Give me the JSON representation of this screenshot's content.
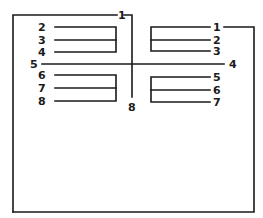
{
  "diagram": {
    "type": "terminal-wiring-schematic",
    "top_labels": {
      "left_one": "1",
      "center_bottom": "8"
    },
    "left_group": {
      "top_rows": [
        {
          "label": "2",
          "y": 27
        },
        {
          "label": "3",
          "y": 40
        },
        {
          "label": "4",
          "y": 52
        }
      ],
      "bottom_rows": [
        {
          "label": "6",
          "y": 75
        },
        {
          "label": "7",
          "y": 88
        },
        {
          "label": "8",
          "y": 101
        }
      ]
    },
    "right_group": {
      "top_rows": [
        {
          "label": "1",
          "y": 27
        },
        {
          "label": "2",
          "y": 40
        },
        {
          "label": "3",
          "y": 51
        }
      ],
      "bottom_rows": [
        {
          "label": "5",
          "y": 77
        },
        {
          "label": "6",
          "y": 90
        },
        {
          "label": "7",
          "y": 102
        }
      ]
    },
    "cross_line": {
      "left_label": "5",
      "right_label": "4",
      "y": 64
    },
    "colors": {
      "line": "#1a1a1a",
      "background": "#ffffff"
    }
  }
}
